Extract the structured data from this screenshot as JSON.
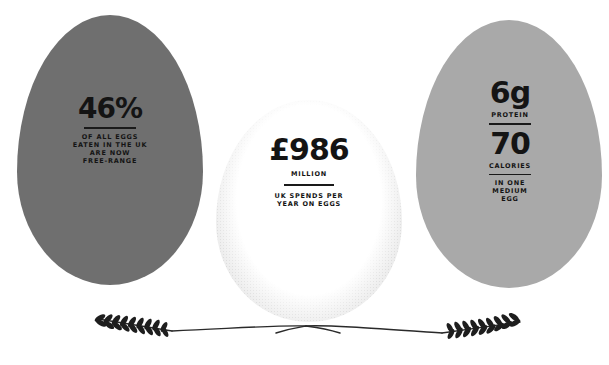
{
  "colors": {
    "background": "#ffffff",
    "egg_left": "#6f6f6f",
    "egg_right": "#a9a9a9",
    "egg_middle_stipple": "#bdbdbd",
    "text": "#141414"
  },
  "eggs": {
    "left": {
      "value": "46%",
      "caption_lines": [
        "OF ALL EGGS",
        "EATEN IN THE UK",
        "ARE NOW",
        "FREE-RANGE"
      ]
    },
    "middle": {
      "value": "£986",
      "unit": "MILLION",
      "caption_lines": [
        "UK SPENDS PER",
        "YEAR ON EGGS"
      ]
    },
    "right": {
      "value_1": "6g",
      "label_1": "PROTEIN",
      "value_2": "70",
      "label_2": "CALORIES",
      "caption_lines": [
        "IN ONE",
        "MEDIUM",
        "EGG"
      ]
    }
  },
  "decoration": {
    "divider": "wheat-sprig-divider"
  }
}
